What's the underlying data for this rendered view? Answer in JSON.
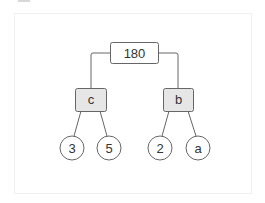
{
  "diagram": {
    "type": "tree",
    "root": {
      "label": "180",
      "shape": "rect",
      "fill": "#ffffff"
    },
    "internal": [
      {
        "label": "c",
        "shape": "rect",
        "fill": "#e6e6e6"
      },
      {
        "label": "b",
        "shape": "rect",
        "fill": "#e6e6e6"
      }
    ],
    "leaves": [
      {
        "label": "3",
        "shape": "circle",
        "parent": "c"
      },
      {
        "label": "5",
        "shape": "circle",
        "parent": "c"
      },
      {
        "label": "2",
        "shape": "circle",
        "parent": "b"
      },
      {
        "label": "a",
        "shape": "circle",
        "parent": "b"
      }
    ],
    "edges": [
      [
        "180",
        "c"
      ],
      [
        "180",
        "b"
      ],
      [
        "c",
        "3"
      ],
      [
        "c",
        "5"
      ],
      [
        "b",
        "2"
      ],
      [
        "b",
        "a"
      ]
    ],
    "colors": {
      "stroke": "#666666",
      "internal_fill": "#e6e6e6",
      "text": "#333333"
    }
  }
}
